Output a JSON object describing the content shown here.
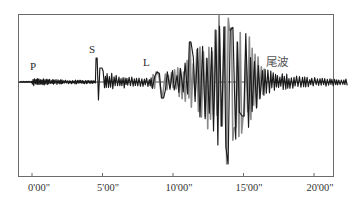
{
  "chart_data": {
    "type": "line",
    "title": "",
    "xlabel": "",
    "ylabel": "",
    "x_ticks": [
      "0'00\"",
      "5'00\"",
      "10'00\"",
      "15'00\"",
      "20'00\""
    ],
    "x_tick_minutes": [
      0,
      5,
      10,
      15,
      20
    ],
    "xlim_minutes": [
      -1,
      22.5
    ],
    "grid": false,
    "legend": null,
    "annotations": [
      {
        "label": "P",
        "time_min": 0.1,
        "note": "P-wave arrival"
      },
      {
        "label": "S",
        "time_min": 4.6,
        "note": "S-wave arrival"
      },
      {
        "label": "L",
        "time_min": 8.6,
        "note": "L (surface) wave arrival"
      },
      {
        "label": "尾波",
        "time_min": 17.6,
        "note": "coda waves"
      }
    ],
    "segments": [
      {
        "phase": "pre-event",
        "start_min": -1.0,
        "end_min": 0.0,
        "relative_amplitude": 0.02
      },
      {
        "phase": "P",
        "start_min": 0.0,
        "end_min": 4.5,
        "relative_amplitude": 0.08
      },
      {
        "phase": "S",
        "start_min": 4.5,
        "end_min": 8.5,
        "relative_amplitude": 0.35
      },
      {
        "phase": "L",
        "start_min": 8.5,
        "end_min": 16.0,
        "relative_amplitude": 1.0,
        "peak_time_min": 13.8
      },
      {
        "phase": "coda",
        "start_min": 16.0,
        "end_min": 22.5,
        "relative_amplitude": 0.12
      }
    ]
  },
  "labels": {
    "p": "P",
    "s": "S",
    "l": "L",
    "coda": "尾波"
  },
  "axis": {
    "ticks": [
      "0'00\"",
      "5'00\"",
      "10'00\"",
      "15'00\"",
      "20'00\""
    ]
  },
  "colors": {
    "frame": "#6b6b6b",
    "trace": "#1a1a1a",
    "trace_light": "#8a8a8a"
  }
}
